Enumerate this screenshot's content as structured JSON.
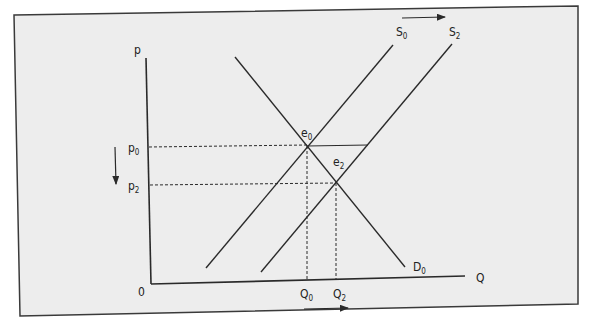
{
  "figure": {
    "type": "supply-demand-diagram",
    "axes": {
      "y_label": "p",
      "x_label": "Q",
      "origin_label": "0"
    },
    "curves": [
      {
        "id": "D0",
        "label": "D",
        "sub": "0",
        "kind": "demand"
      },
      {
        "id": "S0",
        "label": "S",
        "sub": "0",
        "kind": "supply"
      },
      {
        "id": "S2",
        "label": "S",
        "sub": "2",
        "kind": "supply"
      }
    ],
    "equilibria": [
      {
        "id": "e0",
        "label": "e",
        "sub": "0"
      },
      {
        "id": "e2",
        "label": "e",
        "sub": "2"
      }
    ],
    "price_levels": [
      {
        "label": "p",
        "sub": "0"
      },
      {
        "label": "p",
        "sub": "2"
      }
    ],
    "quantity_levels": [
      {
        "label": "Q",
        "sub": "0"
      },
      {
        "label": "Q",
        "sub": "2"
      }
    ],
    "arrows": {
      "supply_shift": "right",
      "price_change": "down",
      "quantity_change": "right"
    },
    "colors": {
      "background": "#ededed",
      "line": "#2a2a2a",
      "frame": "#3a3a3a"
    }
  }
}
